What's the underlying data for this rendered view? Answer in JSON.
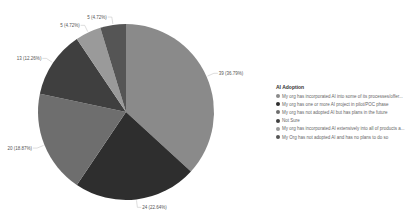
{
  "chart_data": {
    "type": "pie",
    "title": "AI Adoption",
    "legend_position": "right",
    "slices": [
      {
        "label": "My org has incorporated AI into some of its processes/offer...",
        "value": 39,
        "percent": "36.79%",
        "data_label": "39 (36.79%)",
        "color": "#8a8a8a"
      },
      {
        "label": "My org has one or more AI project in pilot/POC phase",
        "value": 24,
        "percent": "22.64%",
        "data_label": "24 (22.64%)",
        "color": "#2e2e2e"
      },
      {
        "label": "My org has not adopted AI but has plans in the future",
        "value": 20,
        "percent": "18.87%",
        "data_label": "20 (18.87%)",
        "color": "#6e6e6e"
      },
      {
        "label": "Not Sure",
        "value": 13,
        "percent": "12.26%",
        "data_label": "13 (12.26%)",
        "color": "#3f3f3f"
      },
      {
        "label": "My org has incorporated AI extensively into all of products a...",
        "value": 5,
        "percent": "4.72%",
        "data_label": "5 (4.72%)",
        "color": "#9a9a9a"
      },
      {
        "label": "My Org has not adopted AI and has no plans to do so",
        "value": 5,
        "percent": "4.72%",
        "data_label": "5 (4.72%)",
        "color": "#555555"
      }
    ]
  },
  "legend": {
    "title": "AI Adoption",
    "items": [
      {
        "label": "My org has incorporated AI into some of its processes/offer...",
        "color": "#8a8a8a"
      },
      {
        "label": "My org has one or more AI project in pilot/POC phase",
        "color": "#2e2e2e"
      },
      {
        "label": "My org has not adopted AI but has plans in the future",
        "color": "#6e6e6e"
      },
      {
        "label": "Not Sure",
        "color": "#3f3f3f"
      },
      {
        "label": "My org has incorporated AI extensively into all of products a...",
        "color": "#9a9a9a"
      },
      {
        "label": "My Org has not adopted AI and has no plans to do so",
        "color": "#555555"
      }
    ]
  }
}
